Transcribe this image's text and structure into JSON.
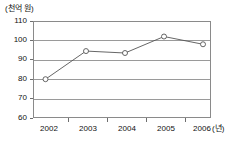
{
  "chart_data": {
    "type": "line",
    "title": "",
    "subtitle": "",
    "unit_label": "(천억 원)",
    "xlabel": "(년)",
    "ylabel": "",
    "categories": [
      "2002",
      "2003",
      "2004",
      "2005",
      "2006"
    ],
    "x": [
      2002,
      2003,
      2004,
      2005,
      2006
    ],
    "series": [
      {
        "name": "",
        "values": [
          80,
          94.5,
          93.5,
          102,
          98
        ]
      }
    ],
    "values": [
      80,
      94.5,
      93.5,
      102,
      98
    ],
    "ylim": [
      60,
      110
    ],
    "yticks": [
      60,
      70,
      80,
      90,
      100,
      110
    ],
    "ytick_labels": [
      "60",
      "70",
      "80",
      "90",
      "100",
      "110"
    ],
    "xtick_labels": [
      "2002",
      "2003",
      "2004",
      "2005",
      "2006"
    ],
    "grid": "horizontal",
    "legend": "none",
    "marker": "open-circle",
    "line_color": "#555555",
    "grid_color": "#9a9a9a",
    "frame_color": "#8a8a8a",
    "background": "#ffffff"
  }
}
